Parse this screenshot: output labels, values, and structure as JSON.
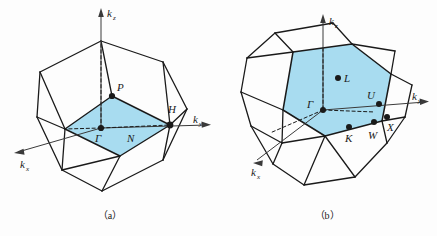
{
  "figure": {
    "panels": [
      {
        "id": "a",
        "caption": "（a）",
        "shape_name": "bcc-brillouin-zone-rhombic-dodecahedron",
        "fill_color": "#a8dcf0",
        "line_color": "#1a1a1a",
        "axes": [
          {
            "name": "kz",
            "label_base": "k",
            "label_sub": "z"
          },
          {
            "name": "ky",
            "label_base": "k",
            "label_sub": "y"
          },
          {
            "name": "kx",
            "label_base": "k",
            "label_sub": "x"
          }
        ],
        "symmetry_points": [
          {
            "name": "gamma",
            "label": "Γ",
            "dot": true
          },
          {
            "name": "n-point",
            "label": "N",
            "dot": false
          },
          {
            "name": "p-point",
            "label": "P",
            "dot": true
          },
          {
            "name": "h-point",
            "label": "H",
            "dot": true
          }
        ]
      },
      {
        "id": "b",
        "caption": "（b）",
        "shape_name": "fcc-brillouin-zone-truncated-octahedron",
        "fill_color": "#a8dcf0",
        "line_color": "#1a1a1a",
        "axes": [
          {
            "name": "kz",
            "label_base": "k",
            "label_sub": "z"
          },
          {
            "name": "ky",
            "label_base": "k",
            "label_sub": "y"
          },
          {
            "name": "kx",
            "label_base": "k",
            "label_sub": "x"
          }
        ],
        "symmetry_points": [
          {
            "name": "gamma",
            "label": "Γ",
            "dot": true
          },
          {
            "name": "l-point",
            "label": "L",
            "dot": true
          },
          {
            "name": "u-point",
            "label": "U",
            "dot": true
          },
          {
            "name": "k-point",
            "label": "K",
            "dot": true
          },
          {
            "name": "w-point",
            "label": "W",
            "dot": true
          },
          {
            "name": "x-point",
            "label": "X",
            "dot": true
          }
        ]
      }
    ]
  },
  "panel_a": {
    "caption": "（a）",
    "axis_kz_base": "k",
    "axis_kz_sub": "z",
    "axis_ky_base": "k",
    "axis_ky_sub": "y",
    "axis_kx_base": "k",
    "axis_kx_sub": "x",
    "pt_gamma": "Γ",
    "pt_n": "N",
    "pt_p": "P",
    "pt_h": "H"
  },
  "panel_b": {
    "caption": "（b）",
    "axis_kz_base": "k",
    "axis_kz_sub": "z",
    "axis_ky_base": "k",
    "axis_ky_sub": "y",
    "axis_kx_base": "k",
    "axis_kx_sub": "x",
    "pt_gamma": "Γ",
    "pt_l": "L",
    "pt_u": "U",
    "pt_k": "K",
    "pt_w": "W",
    "pt_x": "X"
  }
}
